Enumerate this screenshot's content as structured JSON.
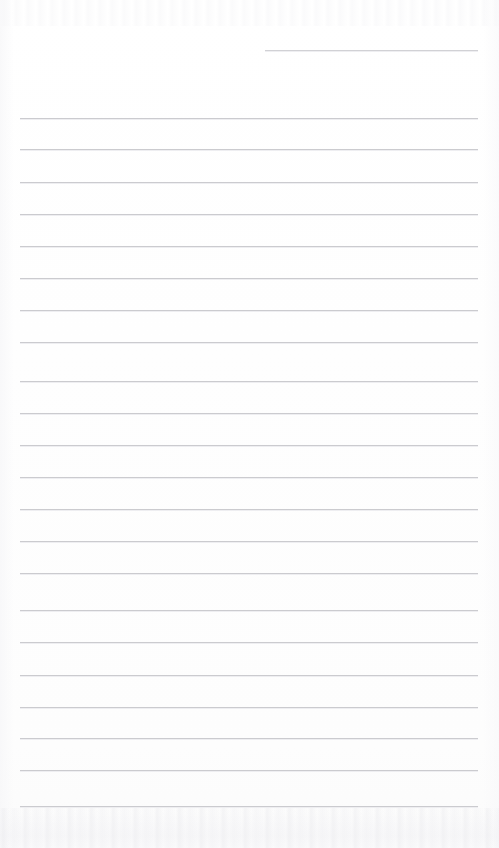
{
  "page": {
    "type": "blank-ruled-paper-scan",
    "width": 499,
    "height": 848,
    "background_color": "#fefefe",
    "rule_color": "#c9c9cd",
    "has_text_content": false,
    "has_handwriting": false,
    "notes": ""
  },
  "ruling": {
    "full_line_count": 22,
    "partial_line_count": 1,
    "line_spacing_px": 32.8,
    "left_margin_px": 20,
    "right_margin_px": 478,
    "first_full_line_y": 118,
    "last_full_line_y": 806
  },
  "lines": [
    {
      "id": "rule-partial-1",
      "y": 50,
      "x1": 265,
      "x2": 478,
      "kind": "partial"
    },
    {
      "id": "rule-1",
      "y": 118,
      "x1": 20,
      "x2": 478,
      "kind": "full"
    },
    {
      "id": "rule-2",
      "y": 149,
      "x1": 20,
      "x2": 478,
      "kind": "full"
    },
    {
      "id": "rule-3",
      "y": 182,
      "x1": 20,
      "x2": 478,
      "kind": "full"
    },
    {
      "id": "rule-4",
      "y": 214,
      "x1": 20,
      "x2": 478,
      "kind": "full"
    },
    {
      "id": "rule-5",
      "y": 246,
      "x1": 20,
      "x2": 478,
      "kind": "full"
    },
    {
      "id": "rule-6",
      "y": 278,
      "x1": 20,
      "x2": 478,
      "kind": "full"
    },
    {
      "id": "rule-7",
      "y": 310,
      "x1": 20,
      "x2": 478,
      "kind": "full"
    },
    {
      "id": "rule-8",
      "y": 342,
      "x1": 20,
      "x2": 478,
      "kind": "full"
    },
    {
      "id": "rule-9",
      "y": 381,
      "x1": 20,
      "x2": 478,
      "kind": "full"
    },
    {
      "id": "rule-10",
      "y": 413,
      "x1": 20,
      "x2": 478,
      "kind": "full"
    },
    {
      "id": "rule-11",
      "y": 445,
      "x1": 20,
      "x2": 478,
      "kind": "full"
    },
    {
      "id": "rule-12",
      "y": 477,
      "x1": 20,
      "x2": 478,
      "kind": "full"
    },
    {
      "id": "rule-13",
      "y": 509,
      "x1": 20,
      "x2": 478,
      "kind": "full"
    },
    {
      "id": "rule-14",
      "y": 541,
      "x1": 20,
      "x2": 478,
      "kind": "full"
    },
    {
      "id": "rule-15",
      "y": 573,
      "x1": 20,
      "x2": 478,
      "kind": "full"
    },
    {
      "id": "rule-16",
      "y": 610,
      "x1": 20,
      "x2": 478,
      "kind": "full"
    },
    {
      "id": "rule-17",
      "y": 642,
      "x1": 20,
      "x2": 478,
      "kind": "full"
    },
    {
      "id": "rule-18",
      "y": 675,
      "x1": 20,
      "x2": 478,
      "kind": "full"
    },
    {
      "id": "rule-19",
      "y": 707,
      "x1": 20,
      "x2": 478,
      "kind": "full"
    },
    {
      "id": "rule-20",
      "y": 738,
      "x1": 20,
      "x2": 478,
      "kind": "full"
    },
    {
      "id": "rule-21",
      "y": 770,
      "x1": 20,
      "x2": 478,
      "kind": "full"
    },
    {
      "id": "rule-22",
      "y": 806,
      "x1": 20,
      "x2": 478,
      "kind": "full"
    }
  ]
}
